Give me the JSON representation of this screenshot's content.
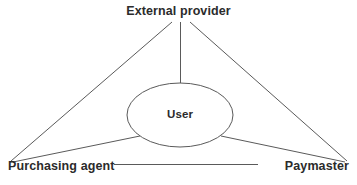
{
  "diagram": {
    "type": "relationship-triangle",
    "background_color": "#ffffff",
    "line_color": "#5a5a5a",
    "text_color": "#2b2b2b",
    "nodes": {
      "apex": {
        "id": "external-provider",
        "label": "External provider",
        "shape": "text",
        "x": 180,
        "y": 12
      },
      "bottom_left": {
        "id": "purchasing-agent",
        "label": "Purchasing agent",
        "shape": "text",
        "x": 62,
        "y": 166
      },
      "bottom_right": {
        "id": "paymaster",
        "label": "Paymaster",
        "shape": "text",
        "x": 312,
        "y": 166
      },
      "center": {
        "id": "user",
        "label": "User",
        "shape": "ellipse",
        "cx": 180,
        "cy": 115,
        "rx": 53,
        "ry": 32
      }
    },
    "edges": [
      {
        "id": "apex-to-bottom-left",
        "from": "external-provider",
        "to": "purchasing-agent",
        "style": "solid"
      },
      {
        "id": "apex-to-bottom-right",
        "from": "external-provider",
        "to": "paymaster",
        "style": "solid"
      },
      {
        "id": "bottom-left-to-bottom-right",
        "from": "purchasing-agent",
        "to": "paymaster",
        "style": "solid"
      },
      {
        "id": "apex-to-user",
        "from": "external-provider",
        "to": "user",
        "style": "solid"
      },
      {
        "id": "user-to-bottom-left",
        "from": "user",
        "to": "purchasing-agent",
        "style": "solid"
      },
      {
        "id": "user-to-bottom-right",
        "from": "user",
        "to": "paymaster",
        "style": "solid"
      }
    ]
  }
}
